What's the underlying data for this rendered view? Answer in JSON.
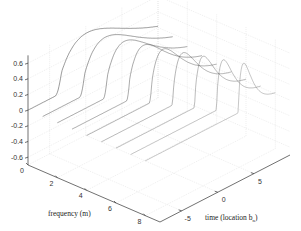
{
  "chart_data": {
    "type": "surface-waterfall-3d",
    "title": "",
    "xlabel": "frequency (m)",
    "ylabel": "time (location b_n)",
    "zlabel": "",
    "x_ticks": [
      "0",
      "2",
      "4",
      "6",
      "8"
    ],
    "y_ticks": [
      "-5",
      "0",
      "5"
    ],
    "z_ticks": [
      "0.6",
      "0.4",
      "0.2",
      "0",
      "-0.2",
      "-0.4",
      "-0.6"
    ],
    "xlim": [
      0,
      9
    ],
    "ylim": [
      -8,
      10
    ],
    "zlim": [
      -0.7,
      0.7
    ],
    "grid": true,
    "series_frequencies": [
      0,
      1,
      2,
      3,
      4,
      5,
      6,
      7,
      8
    ],
    "peak_amplitude_approx": 0.6
  },
  "axes": {
    "x_label": "frequency (m)",
    "y_label_main": "time (location b",
    "y_label_sub": "n",
    "y_label_close": ")"
  }
}
